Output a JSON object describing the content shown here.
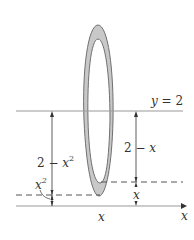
{
  "diagram": {
    "type": "washer-cross-section",
    "colors": {
      "ring_fill": "#c8c8c8",
      "ring_stroke": "#707070",
      "line": "#9a9a9a",
      "dashed": "#555555",
      "arrow": "#333333",
      "text": "#333333"
    },
    "labels": {
      "line_y2": "y = 2",
      "outer_radius_var": "2 − x",
      "outer_radius_exp": "2",
      "inner_radius_prefix": "2 − x",
      "inner_radius_exp": "2",
      "x_squared_base": "x",
      "x_squared_exp": "2",
      "x_small": "x",
      "x_bottom": "x",
      "x_axis": "x"
    }
  }
}
